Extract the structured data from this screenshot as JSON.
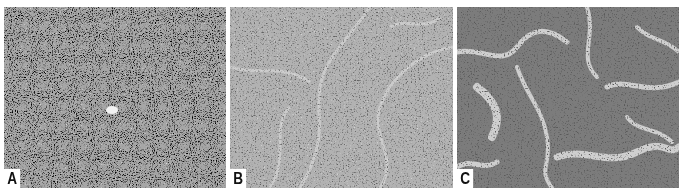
{
  "figure": {
    "background": "#ffffff",
    "panels": [
      {
        "label": "A",
        "description": "Micrograph with dense, uniform small dark cells and a small central clear space"
      },
      {
        "label": "B",
        "description": "Micrograph with densely packed cells and faint curving pale septa"
      },
      {
        "label": "C",
        "description": "Micrograph with cords/nests of dark cells separated by pale stromal channels"
      }
    ]
  }
}
